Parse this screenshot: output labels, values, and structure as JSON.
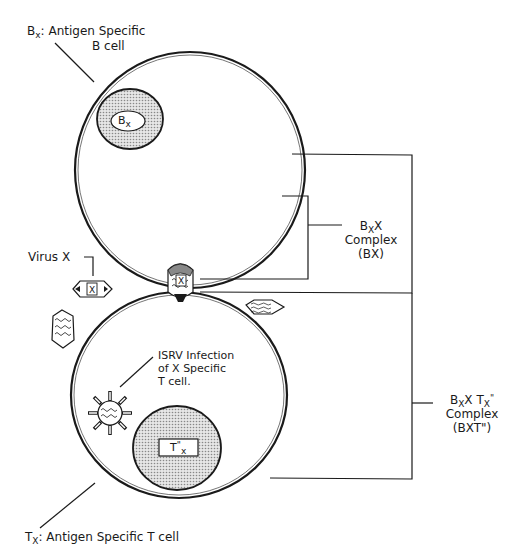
{
  "labels": {
    "b_cell": {
      "symbol": "B",
      "subscript": "x",
      "text": ": Antigen Specific",
      "line2": "B cell"
    },
    "b_nucleus": {
      "symbol": "B",
      "subscript": "x"
    },
    "virus_x": {
      "text": "Virus X",
      "particle_mark": "X"
    },
    "bx_complex": {
      "symbol1": "B",
      "sub1": "X",
      "symbol2": "X",
      "line2": "Complex",
      "line3": "(BX)"
    },
    "isrv_infection": {
      "line1": "ISRV Infection",
      "line2": "of X Specific",
      "line3": "T cell."
    },
    "t_nucleus": {
      "symbol": "T",
      "prime": "\"",
      "subscript": "x"
    },
    "bxt_complex": {
      "symbol1": "B",
      "sub1": "X",
      "symbol2": "X T",
      "sub2": "X",
      "prime": "\"",
      "line2": "Complex",
      "line3": "(BXT\")"
    },
    "t_cell": {
      "symbol": "T",
      "subscript": "X",
      "text": ":  Antigen Specific T cell"
    }
  },
  "colors": {
    "line": "#1a1a1a",
    "nucleus_fill": "#c8c8c8",
    "background": "#ffffff"
  }
}
